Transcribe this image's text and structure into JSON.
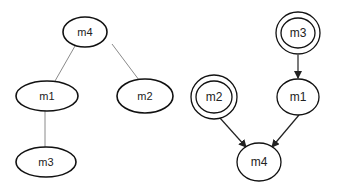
{
  "colors": {
    "background": "#ffffff",
    "node_stroke": "#111111",
    "tree_edge": "#8a8a8a",
    "arrow_edge": "#222222",
    "text": "#222222"
  },
  "left_tree": {
    "type": "undirected-tree",
    "nodes": [
      {
        "id": "m4",
        "label": "m4",
        "cx": 85,
        "cy": 32,
        "rx": 22,
        "ry": 15
      },
      {
        "id": "m1",
        "label": "m1",
        "cx": 47,
        "cy": 96,
        "rx": 31,
        "ry": 15
      },
      {
        "id": "m2",
        "label": "m2",
        "cx": 145,
        "cy": 96,
        "rx": 28,
        "ry": 17
      },
      {
        "id": "m3",
        "label": "m3",
        "cx": 46,
        "cy": 162,
        "rx": 30,
        "ry": 15
      }
    ],
    "edges": [
      {
        "from": "m4",
        "to": "m1"
      },
      {
        "from": "m4",
        "to": "m2"
      },
      {
        "from": "m1",
        "to": "m3"
      }
    ]
  },
  "right_graph": {
    "type": "directed-graph",
    "nodes": [
      {
        "id": "m3",
        "label": "m3",
        "double": true
      },
      {
        "id": "m1",
        "label": "m1",
        "double": false
      },
      {
        "id": "m2",
        "label": "m2",
        "double": true
      },
      {
        "id": "m4",
        "label": "m4",
        "double": false
      }
    ],
    "edges": [
      {
        "from": "m3",
        "to": "m1"
      },
      {
        "from": "m2",
        "to": "m4"
      },
      {
        "from": "m1",
        "to": "m4"
      }
    ]
  }
}
